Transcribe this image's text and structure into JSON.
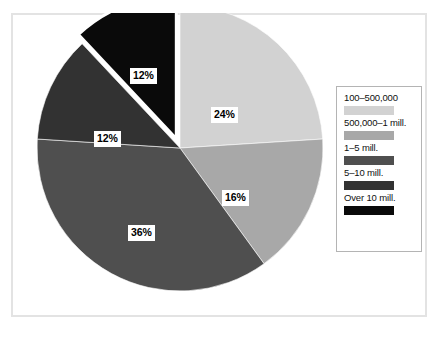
{
  "figure": {
    "frame_border_color": "#e3e3e3",
    "background_color": "#ffffff"
  },
  "legend": {
    "border_color": "#b4b4b4",
    "entries": [
      {
        "label": "100–500,000",
        "color": "#d2d2d2"
      },
      {
        "label": "500,000–1 mill.",
        "color": "#a8a8a8"
      },
      {
        "label": "1–5 mill.",
        "color": "#4f4f4f"
      },
      {
        "label": "5–10 mill.",
        "color": "#323232"
      },
      {
        "label": "Over 10 mill.",
        "color": "#0a0a0a"
      }
    ]
  },
  "chart_data": {
    "type": "pie",
    "title": "",
    "legend_position": "right",
    "start_angle_deg": 0,
    "direction": "clockwise",
    "center": {
      "x": 180,
      "y": 148
    },
    "radius": 143,
    "categories": [
      "100–500,000",
      "500,000–1 mill.",
      "1–5 mill.",
      "5–10 mill.",
      "Over 10 mill."
    ],
    "values": [
      24,
      16,
      36,
      12,
      12
    ],
    "labels": [
      "24%",
      "16%",
      "36%",
      "12%",
      "12%"
    ],
    "colors": [
      "#d2d2d2",
      "#a8a8a8",
      "#4f4f4f",
      "#323232",
      "#0a0a0a"
    ],
    "exploded": [
      false,
      false,
      false,
      false,
      true
    ],
    "explode_offset": 10,
    "slice_gap_color": "#ffffff",
    "label_positions": [
      {
        "x": 211,
        "y": 107
      },
      {
        "x": 222,
        "y": 190
      },
      {
        "x": 128,
        "y": 225
      },
      {
        "x": 94,
        "y": 131
      },
      {
        "x": 130,
        "y": 68
      }
    ]
  }
}
